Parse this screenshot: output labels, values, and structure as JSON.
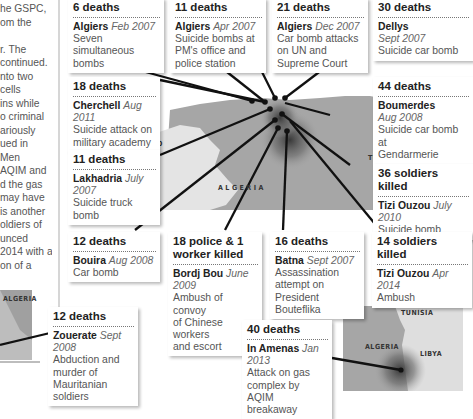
{
  "article_text": {
    "lines": [
      "he GSPC,",
      "om the",
      "",
      "r. The",
      "continued.",
      "nto two",
      " cells",
      "ins while",
      "o criminal",
      "ariously",
      "ued in",
      " Men",
      "AQIM and",
      "d the gas",
      "may have",
      "is another",
      "oldiers of",
      "unced",
      "2014 with a",
      "on of a"
    ]
  },
  "map_labels": {
    "morocco": "MOROCCO",
    "algeria_main": "ALGERIA",
    "tunisia_main": "TUNISIA",
    "algeria_inset_left": "ALGERIA",
    "algeria_inset_right": "ALGERIA",
    "tunisia_inset": "TUNISIA",
    "libya_inset": "LIBYA"
  },
  "incidents": [
    {
      "id": "algiers-feb-2007",
      "toll": "6 deaths",
      "place": "Algiers",
      "date": "Feb 2007",
      "desc": [
        "Seven simultaneous",
        "bombs"
      ]
    },
    {
      "id": "algiers-apr-2007",
      "toll": "11 deaths",
      "place": "Algiers",
      "date": "Apr 2007",
      "desc": [
        "Suicide bombs at",
        "PM's office and",
        "police station"
      ]
    },
    {
      "id": "algiers-dec-2007",
      "toll": "21 deaths",
      "place": "Algiers",
      "date": "Dec 2007",
      "desc": [
        "Car bomb attacks",
        "on UN and",
        "Supreme Court"
      ]
    },
    {
      "id": "dellys-sept-2007",
      "toll": "30 deaths",
      "place": "Dellys",
      "date": "Sept 2007",
      "desc": [
        "Suicide car bomb"
      ]
    },
    {
      "id": "cherchell-aug-2011",
      "toll": "18 deaths",
      "place": "Cherchell",
      "date": "Aug 2011",
      "desc": [
        "Suicide attack on",
        "military academy"
      ]
    },
    {
      "id": "boumerdes-aug-2008",
      "toll": "44 deaths",
      "place": "Boumerdes",
      "date": "Aug 2008",
      "desc": [
        "Suicide car bomb at",
        "Gendarmerie"
      ]
    },
    {
      "id": "lakhadria-july-2007",
      "toll": "11 deaths",
      "place": "Lakhadria",
      "date": "July 2007",
      "desc": [
        "Suicide truck bomb"
      ]
    },
    {
      "id": "tizi-ouzou-july-2010",
      "toll": "36 soldiers killed",
      "place": "Tizi Ouzou",
      "date": "July 2010",
      "desc": [
        "Suicide bomb"
      ]
    },
    {
      "id": "bouira-aug-2008",
      "toll": "12 deaths",
      "place": "Bouira",
      "date": "Aug 2008",
      "desc": [
        "Car bomb"
      ]
    },
    {
      "id": "bordj-bou-june-2009",
      "toll": "18 police & 1 worker killed",
      "place": "Bordj Bou",
      "date": "June 2009",
      "desc": [
        "Ambush of convoy",
        "of Chinese workers",
        "and escort"
      ]
    },
    {
      "id": "batna-sept-2007",
      "toll": "16 deaths",
      "place": "Batna",
      "date": "Sept 2007",
      "desc": [
        "Assassination",
        "attempt on",
        "President Bouteflika"
      ]
    },
    {
      "id": "tizi-ouzou-apr-2014",
      "toll": "14 soldiers killed",
      "place": "Tizi Ouzou",
      "date": "Apr 2014",
      "desc": [
        "Ambush"
      ]
    },
    {
      "id": "zouerate-sept-2008",
      "toll": "12 deaths",
      "place": "Zouerate",
      "date": "Sept 2008",
      "desc": [
        "Abduction and",
        "murder of",
        "Mauritanian",
        "soldiers"
      ]
    },
    {
      "id": "in-amenas-jan-2013",
      "toll": "40 deaths",
      "place": "In Amenas",
      "date": "Jan 2013",
      "desc": [
        "Attack on gas",
        "complex by AQIM",
        "breakaway"
      ]
    }
  ],
  "colors": {
    "land": "#a6a6a6",
    "land_light": "#e2e2e2",
    "sea": "#ffffff",
    "leader_line": "#111111",
    "dot": "#111111"
  }
}
